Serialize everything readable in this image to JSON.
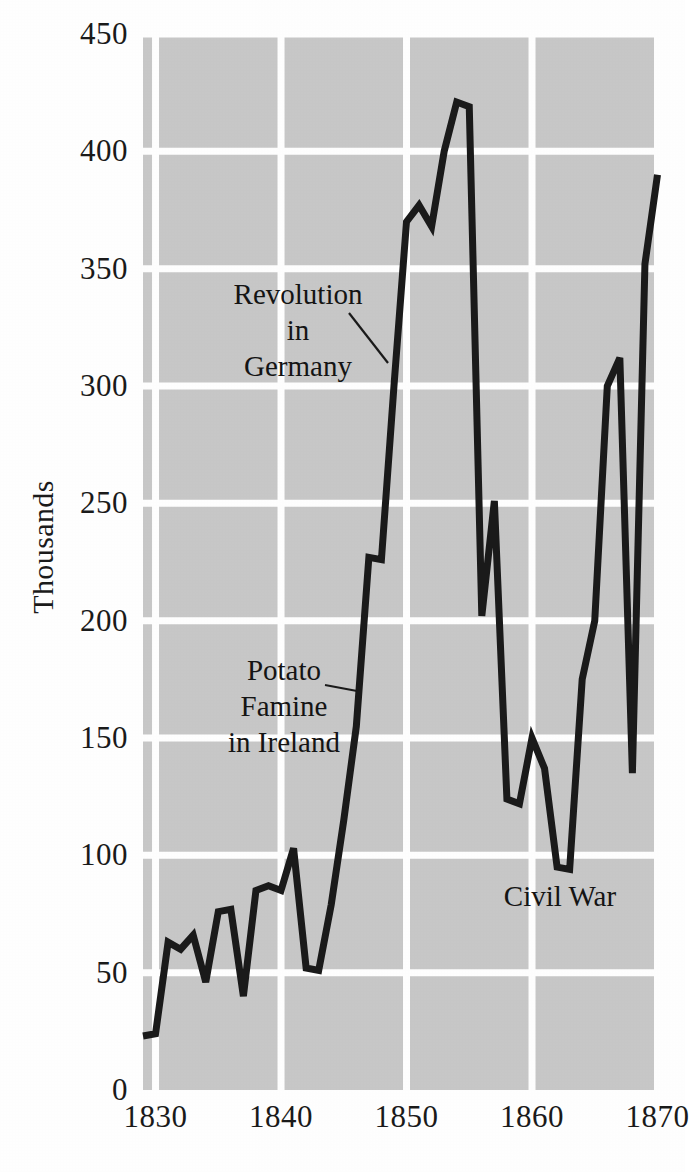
{
  "chart_data": {
    "type": "line",
    "title": "",
    "xlabel": "",
    "ylabel": "Thousands",
    "xlim": [
      1829,
      1870
    ],
    "ylim": [
      0,
      450
    ],
    "grid": true,
    "legend": "none",
    "x_ticks": [
      1830,
      1840,
      1850,
      1860,
      1870
    ],
    "y_ticks": [
      0,
      50,
      100,
      150,
      200,
      250,
      300,
      350,
      400,
      450
    ],
    "x": [
      1829,
      1830,
      1831,
      1832,
      1833,
      1834,
      1835,
      1836,
      1837,
      1838,
      1839,
      1840,
      1841,
      1842,
      1843,
      1844,
      1845,
      1846,
      1847,
      1848,
      1849,
      1850,
      1851,
      1852,
      1853,
      1854,
      1855,
      1856,
      1857,
      1858,
      1859,
      1860,
      1861,
      1862,
      1863,
      1864,
      1865,
      1866,
      1867,
      1868,
      1869,
      1870
    ],
    "values": [
      23,
      24,
      63,
      60,
      66,
      46,
      76,
      77,
      40,
      85,
      87,
      85,
      103,
      52,
      51,
      79,
      115,
      155,
      227,
      226,
      300,
      370,
      377,
      368,
      400,
      421,
      419,
      202,
      251,
      124,
      122,
      150,
      137,
      95,
      94,
      175,
      200,
      300,
      312,
      135,
      352,
      390
    ],
    "series_label": "Immigration to the United States",
    "annotations": [
      {
        "id": "revolution",
        "lines": [
          "Revolution",
          "in",
          "Germany"
        ],
        "text": "Revolution in Germany",
        "anchor_year": 1849,
        "anchor_value": 300
      },
      {
        "id": "famine",
        "lines": [
          "Potato",
          "Famine",
          "in Ireland"
        ],
        "text": "Potato Famine in Ireland",
        "anchor_year": 1847,
        "anchor_value": 240
      },
      {
        "id": "civilwar",
        "lines": [
          "Civil War"
        ],
        "text": "Civil War",
        "anchor_year": 1863,
        "anchor_value": 94
      }
    ]
  },
  "style": {
    "plot_background": "#c8c8c8",
    "grid_color": "#ffffff",
    "line_color": "#1a1a1a",
    "page_background": "#ffffff",
    "text_color": "#141414"
  }
}
